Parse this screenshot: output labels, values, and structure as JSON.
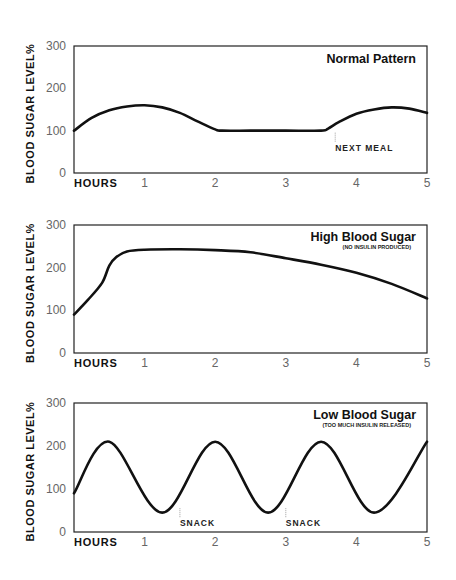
{
  "chart_data": [
    {
      "type": "line",
      "title": "Normal Pattern",
      "subtitle": "",
      "xlabel": "HOURS",
      "ylabel": "BLOOD SUGAR LEVEL%",
      "xlim": [
        0,
        5
      ],
      "ylim": [
        0,
        300
      ],
      "x_ticks": [
        "1",
        "2",
        "3",
        "4",
        "5"
      ],
      "y_ticks": [
        "0",
        "100",
        "200",
        "300"
      ],
      "grid": false,
      "series": [
        {
          "name": "Normal Pattern",
          "x": [
            0,
            0.25,
            0.5,
            0.75,
            1.0,
            1.25,
            1.5,
            1.75,
            2.0,
            2.1,
            2.5,
            3.0,
            3.5,
            3.6,
            3.75,
            4.0,
            4.25,
            4.5,
            4.75,
            5.0
          ],
          "values": [
            100,
            130,
            148,
            157,
            160,
            155,
            142,
            122,
            103,
            100,
            100,
            100,
            100,
            105,
            120,
            140,
            150,
            155,
            152,
            142
          ]
        }
      ],
      "annotations": [
        {
          "text": "NEXT MEAL",
          "x": 3.7,
          "y": 100
        }
      ]
    },
    {
      "type": "line",
      "title": "High Blood Sugar",
      "subtitle": "(NO INSULIN PRODUCED)",
      "xlabel": "HOURS",
      "ylabel": "BLOOD SUGAR LEVEL%",
      "xlim": [
        0,
        5
      ],
      "ylim": [
        0,
        300
      ],
      "x_ticks": [
        "1",
        "2",
        "3",
        "4",
        "5"
      ],
      "y_ticks": [
        "0",
        "100",
        "200",
        "300"
      ],
      "grid": false,
      "series": [
        {
          "name": "High Blood Sugar",
          "x": [
            0,
            0.2,
            0.4,
            0.5,
            0.6,
            0.75,
            1.0,
            1.5,
            2.0,
            2.5,
            3.0,
            3.5,
            4.0,
            4.5,
            5.0
          ],
          "values": [
            90,
            125,
            165,
            205,
            225,
            238,
            242,
            243,
            241,
            236,
            222,
            207,
            188,
            162,
            128
          ]
        }
      ],
      "annotations": []
    },
    {
      "type": "line",
      "title": "Low Blood Sugar",
      "subtitle": "(TOO MUCH INSULIN RELEASED)",
      "xlabel": "HOURS",
      "ylabel": "BLOOD SUGAR LEVEL%",
      "xlim": [
        0,
        5
      ],
      "ylim": [
        0,
        300
      ],
      "x_ticks": [
        "1",
        "2",
        "3",
        "4",
        "5"
      ],
      "y_ticks": [
        "0",
        "100",
        "200",
        "300"
      ],
      "grid": false,
      "series": [
        {
          "name": "Low Blood Sugar",
          "x": [
            0,
            0.5,
            1.25,
            2.0,
            2.75,
            3.5,
            4.25,
            5.0
          ],
          "values": [
            90,
            210,
            45,
            210,
            45,
            210,
            45,
            210
          ]
        }
      ],
      "annotations": [
        {
          "text": "SNACK",
          "x": 1.5,
          "y": 60
        },
        {
          "text": "SNACK",
          "x": 3.0,
          "y": 60
        }
      ]
    }
  ],
  "panels": [
    {
      "top": 46,
      "bottom": 173
    },
    {
      "top": 225,
      "bottom": 353
    },
    {
      "top": 403,
      "bottom": 532
    }
  ],
  "colors": {
    "line": "#111111",
    "frame": "#222222",
    "tick_text": "#666666",
    "marker": "#888888"
  }
}
